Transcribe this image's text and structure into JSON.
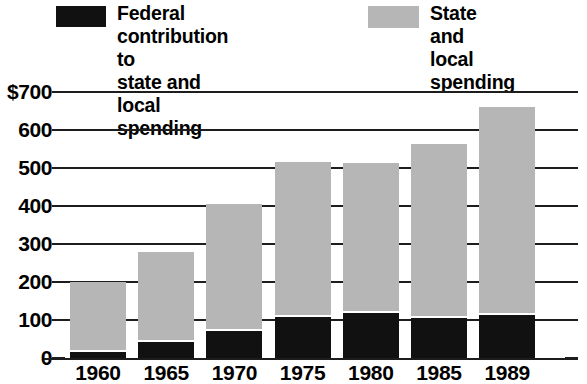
{
  "legend": {
    "entries": [
      {
        "key": "federal",
        "label": "Federal contribution to\nstate and local spending",
        "color": "#111111",
        "swatch_name": "legend-swatch-federal"
      },
      {
        "key": "state",
        "label": "State and\nlocal spending",
        "color": "#b6b6b6",
        "swatch_name": "legend-swatch-state"
      }
    ]
  },
  "axes": {
    "y_ticks": [
      "$700",
      "600",
      "500",
      "400",
      "300",
      "200",
      "100",
      "0"
    ],
    "x_ticks": [
      "1960",
      "1965",
      "1970",
      "1975",
      "1980",
      "1985",
      "1989"
    ]
  },
  "chart_data": {
    "type": "bar",
    "stacked": true,
    "title": "",
    "subtitle": "",
    "xlabel": "",
    "ylabel": "",
    "ylim": [
      0,
      700
    ],
    "ytick_values": [
      0,
      100,
      200,
      300,
      400,
      500,
      600,
      700
    ],
    "ytick_labels": [
      "0",
      "100",
      "200",
      "300",
      "400",
      "500",
      "600",
      "$700"
    ],
    "grid": true,
    "legend_position": "top",
    "units": "billions of dollars",
    "categories": [
      "1960",
      "1965",
      "1970",
      "1975",
      "1980",
      "1985",
      "1989"
    ],
    "series": [
      {
        "name": "Federal contribution to state and local spending",
        "color": "#111111",
        "values": [
          15,
          42,
          70,
          107,
          118,
          105,
          113
        ]
      },
      {
        "name": "State and local spending",
        "color": "#b6b6b6",
        "values": [
          185,
          238,
          335,
          408,
          395,
          458,
          547
        ]
      }
    ],
    "totals": [
      200,
      280,
      405,
      515,
      513,
      563,
      660
    ]
  }
}
